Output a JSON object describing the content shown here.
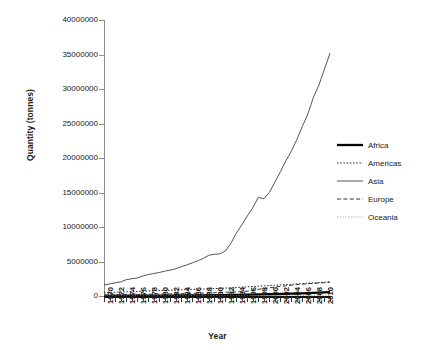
{
  "chart_data": {
    "type": "line",
    "title": "",
    "xlabel": "Year",
    "ylabel": "Quantity (tonnes)",
    "xlim": [
      1970,
      2011
    ],
    "ylim": [
      0,
      40000000
    ],
    "grid": false,
    "legend_position": "right",
    "y_ticks": [
      0,
      5000000,
      10000000,
      15000000,
      20000000,
      25000000,
      30000000,
      35000000,
      40000000
    ],
    "y_tick_labels": [
      "0",
      "5000000",
      "10000000",
      "15000000",
      "20000000",
      "25000000",
      "30000000",
      "35000000",
      "40000000"
    ],
    "x_ticks": [
      1970,
      1972,
      1974,
      1976,
      1978,
      1980,
      1982,
      1984,
      1986,
      1988,
      1990,
      1992,
      1994,
      1996,
      1998,
      2000,
      2002,
      2004,
      2006,
      2008,
      2010
    ],
    "x_tick_labels": [
      "1970",
      "1972",
      "1974",
      "1976",
      "1978",
      "1980",
      "1982",
      "1984",
      "1986",
      "1988",
      "1990",
      "1992",
      "1994",
      "1996",
      "1998",
      "2000",
      "2002",
      "2004",
      "2006",
      "2008",
      "2010"
    ],
    "x": [
      1970,
      1971,
      1972,
      1973,
      1974,
      1975,
      1976,
      1977,
      1978,
      1979,
      1980,
      1981,
      1982,
      1983,
      1984,
      1985,
      1986,
      1987,
      1988,
      1989,
      1990,
      1991,
      1992,
      1993,
      1994,
      1995,
      1996,
      1997,
      1998,
      1999,
      2000,
      2001,
      2002,
      2003,
      2004,
      2005,
      2006,
      2007,
      2008,
      2009,
      2010,
      2011
    ],
    "series": [
      {
        "name": "Africa",
        "style": "solid-thick",
        "color": "#000000",
        "values": [
          30000,
          32000,
          34000,
          36000,
          38000,
          40000,
          43000,
          46000,
          50000,
          54000,
          58000,
          62000,
          66000,
          70000,
          75000,
          80000,
          86000,
          92000,
          99000,
          107000,
          115000,
          124000,
          134000,
          145000,
          157000,
          170000,
          184000,
          199000,
          215000,
          232000,
          250000,
          270000,
          291000,
          313000,
          337000,
          363000,
          390000,
          419000,
          450000,
          483000,
          518000,
          555000
        ]
      },
      {
        "name": "Americas",
        "style": "dotted",
        "color": "#333333",
        "values": [
          480000,
          520000,
          545000,
          580000,
          610000,
          640000,
          665000,
          690000,
          720000,
          755000,
          785000,
          810000,
          840000,
          865000,
          900000,
          930000,
          955000,
          985000,
          1010000,
          1045000,
          1075000,
          1105000,
          1140000,
          1180000,
          1230000,
          1290000,
          1330000,
          1370000,
          1420000,
          1470000,
          1520000,
          1560000,
          1610000,
          1660000,
          1700000,
          1760000,
          1810000,
          1860000,
          1910000,
          1950000,
          2000000,
          2060000
        ]
      },
      {
        "name": "Asia",
        "style": "solid",
        "color": "#555555",
        "values": [
          1600000,
          1750000,
          1900000,
          2050000,
          2350000,
          2500000,
          2600000,
          2900000,
          3100000,
          3250000,
          3400000,
          3600000,
          3750000,
          3950000,
          4250000,
          4500000,
          4800000,
          5100000,
          5450000,
          5900000,
          6050000,
          6100000,
          6500000,
          7600000,
          9100000,
          10300000,
          11600000,
          12800000,
          14300000,
          14100000,
          15000000,
          16500000,
          18000000,
          19600000,
          21000000,
          22700000,
          24600000,
          26400000,
          28800000,
          30600000,
          32900000,
          35200000
        ]
      },
      {
        "name": "Europe",
        "style": "dashed",
        "color": "#333333",
        "values": [
          150000,
          160000,
          170000,
          180000,
          195000,
          205000,
          215000,
          230000,
          245000,
          260000,
          275000,
          290000,
          305000,
          320000,
          340000,
          360000,
          380000,
          400000,
          420000,
          445000,
          470000,
          500000,
          530000,
          565000,
          600000,
          640000,
          700000,
          820000,
          980000,
          1080000,
          1180000,
          1300000,
          1400000,
          1480000,
          1560000,
          1650000,
          1720000,
          1780000,
          1830000,
          1880000,
          1930000,
          2000000
        ]
      },
      {
        "name": "Oceania",
        "style": "dotted-light",
        "color": "#9a9a9a",
        "values": [
          8000,
          8500,
          9000,
          9500,
          10000,
          10500,
          11000,
          12000,
          12500,
          13000,
          14000,
          15000,
          16000,
          17000,
          18000,
          19000,
          20000,
          21500,
          23000,
          24500,
          26000,
          28000,
          30000,
          32000,
          34000,
          36000,
          38000,
          41000,
          44000,
          47000,
          50000,
          53000,
          56000,
          60000,
          64000,
          68000,
          72000,
          76000,
          80000,
          85000,
          90000,
          95000
        ]
      }
    ]
  },
  "legend": {
    "items": [
      {
        "label": "Africa"
      },
      {
        "label": "Americas"
      },
      {
        "label": "Asia"
      },
      {
        "label": "Europe"
      },
      {
        "label": "Oceania"
      }
    ]
  }
}
